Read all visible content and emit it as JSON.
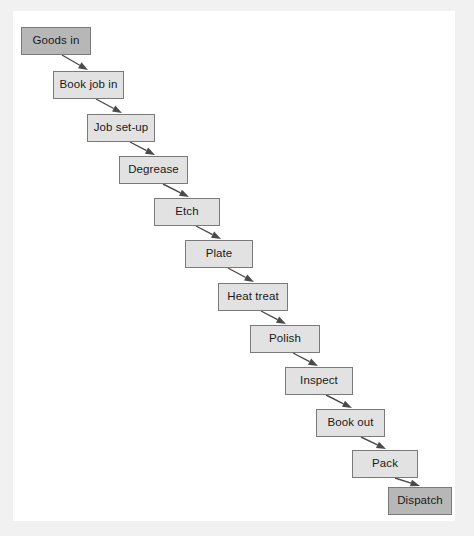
{
  "page": {
    "background": "#ffffff",
    "outer_background": "#f1f1f1"
  },
  "colors": {
    "node_fill": "#e2e2e2",
    "node_accent_fill": "#b7b7b7",
    "node_border": "#7a7a7a",
    "text": "#1a1a1a",
    "arrow": "#4a4a4a"
  },
  "chart_data": {
    "type": "diagram",
    "diagram_kind": "linear-flowchart",
    "orientation": "diagonal-descending",
    "nodes": [
      {
        "id": "goods-in",
        "label": "Goods in",
        "style": "accent",
        "x": 21,
        "y": 27,
        "w": 70,
        "h": 28
      },
      {
        "id": "book-job-in",
        "label": "Book job in",
        "style": "normal",
        "x": 53,
        "y": 71,
        "w": 71,
        "h": 28
      },
      {
        "id": "job-set-up",
        "label": "Job set-up",
        "style": "normal",
        "x": 87,
        "y": 114,
        "w": 68,
        "h": 28
      },
      {
        "id": "degrease",
        "label": "Degrease",
        "style": "normal",
        "x": 119,
        "y": 156,
        "w": 69,
        "h": 28
      },
      {
        "id": "etch",
        "label": "Etch",
        "style": "normal",
        "x": 154,
        "y": 198,
        "w": 66,
        "h": 28
      },
      {
        "id": "plate",
        "label": "Plate",
        "style": "normal",
        "x": 185,
        "y": 240,
        "w": 68,
        "h": 28
      },
      {
        "id": "heat-treat",
        "label": "Heat treat",
        "style": "normal",
        "x": 218,
        "y": 283,
        "w": 70,
        "h": 28
      },
      {
        "id": "polish",
        "label": "Polish",
        "style": "normal",
        "x": 250,
        "y": 325,
        "w": 70,
        "h": 28
      },
      {
        "id": "inspect",
        "label": "Inspect",
        "style": "normal",
        "x": 285,
        "y": 367,
        "w": 68,
        "h": 28
      },
      {
        "id": "book-out",
        "label": "Book out",
        "style": "normal",
        "x": 316,
        "y": 409,
        "w": 69,
        "h": 28
      },
      {
        "id": "pack",
        "label": "Pack",
        "style": "normal",
        "x": 352,
        "y": 450,
        "w": 66,
        "h": 28
      },
      {
        "id": "dispatch",
        "label": "Dispatch",
        "style": "accent",
        "x": 388,
        "y": 487,
        "w": 64,
        "h": 28
      }
    ],
    "edges": [
      {
        "from": "goods-in",
        "to": "book-job-in",
        "x1": 62,
        "y1": 55,
        "x2": 88,
        "y2": 70
      },
      {
        "from": "book-job-in",
        "to": "job-set-up",
        "x1": 96,
        "y1": 99,
        "x2": 122,
        "y2": 113
      },
      {
        "from": "job-set-up",
        "to": "degrease",
        "x1": 130,
        "y1": 142,
        "x2": 155,
        "y2": 155
      },
      {
        "from": "degrease",
        "to": "etch",
        "x1": 163,
        "y1": 184,
        "x2": 189,
        "y2": 197
      },
      {
        "from": "etch",
        "to": "plate",
        "x1": 196,
        "y1": 226,
        "x2": 221,
        "y2": 239
      },
      {
        "from": "plate",
        "to": "heat-treat",
        "x1": 228,
        "y1": 268,
        "x2": 254,
        "y2": 282
      },
      {
        "from": "heat-treat",
        "to": "polish",
        "x1": 261,
        "y1": 311,
        "x2": 286,
        "y2": 324
      },
      {
        "from": "polish",
        "to": "inspect",
        "x1": 293,
        "y1": 353,
        "x2": 318,
        "y2": 366
      },
      {
        "from": "inspect",
        "to": "book-out",
        "x1": 326,
        "y1": 395,
        "x2": 352,
        "y2": 408
      },
      {
        "from": "book-out",
        "to": "pack",
        "x1": 361,
        "y1": 437,
        "x2": 386,
        "y2": 449
      },
      {
        "from": "pack",
        "to": "dispatch",
        "x1": 395,
        "y1": 478,
        "x2": 420,
        "y2": 486
      }
    ]
  }
}
